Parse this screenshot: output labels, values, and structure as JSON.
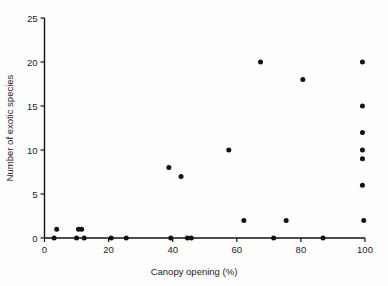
{
  "chart_data": {
    "type": "scatter",
    "title": "",
    "xlabel": "Canopy opening (%)",
    "ylabel": "Number of exotic species",
    "xlim": [
      0,
      100
    ],
    "ylim": [
      0,
      25
    ],
    "xticks": [
      0,
      20,
      40,
      60,
      80,
      100
    ],
    "yticks": [
      0,
      5,
      10,
      15,
      20,
      25
    ],
    "xtick_labels": [
      "0",
      "20",
      "40",
      "60",
      "80",
      "100"
    ],
    "ytick_labels": [
      "0",
      "5",
      "10",
      "15",
      "20",
      "25"
    ],
    "grid": false,
    "legend": null,
    "marker": "filled-circle",
    "marker_color": "#111111",
    "points": [
      {
        "x": 3.0,
        "y": 0
      },
      {
        "x": 3.8,
        "y": 1
      },
      {
        "x": 10.0,
        "y": 0
      },
      {
        "x": 10.6,
        "y": 1
      },
      {
        "x": 11.6,
        "y": 1
      },
      {
        "x": 12.4,
        "y": 0
      },
      {
        "x": 20.8,
        "y": 0
      },
      {
        "x": 25.5,
        "y": 0
      },
      {
        "x": 38.8,
        "y": 8
      },
      {
        "x": 39.4,
        "y": 0
      },
      {
        "x": 42.6,
        "y": 7
      },
      {
        "x": 44.6,
        "y": 0
      },
      {
        "x": 45.8,
        "y": 0
      },
      {
        "x": 57.5,
        "y": 10
      },
      {
        "x": 62.2,
        "y": 2
      },
      {
        "x": 67.4,
        "y": 20
      },
      {
        "x": 71.5,
        "y": 0
      },
      {
        "x": 75.4,
        "y": 2
      },
      {
        "x": 80.6,
        "y": 18
      },
      {
        "x": 86.9,
        "y": 0
      },
      {
        "x": 99.2,
        "y": 20
      },
      {
        "x": 99.2,
        "y": 15
      },
      {
        "x": 99.2,
        "y": 12
      },
      {
        "x": 99.2,
        "y": 10
      },
      {
        "x": 99.2,
        "y": 9
      },
      {
        "x": 99.2,
        "y": 6
      },
      {
        "x": 99.6,
        "y": 2
      }
    ]
  },
  "axes": {
    "x_axis_name": "canopy-opening-axis",
    "y_axis_name": "exotic-species-axis"
  }
}
